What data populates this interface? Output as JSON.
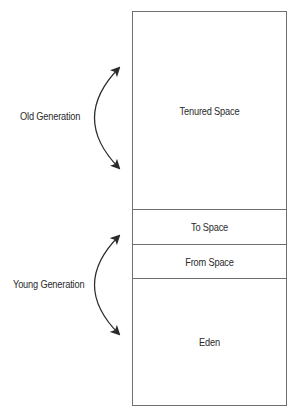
{
  "diagram": {
    "generations": [
      {
        "label": "Old Generation",
        "regions": [
          "Tenured Space"
        ]
      },
      {
        "label": "Young Generation",
        "regions": [
          "To Space",
          "From Space",
          "Eden"
        ]
      }
    ],
    "regions": {
      "tenured": "Tenured Space",
      "to_space": "To Space",
      "from_space": "From Space",
      "eden": "Eden"
    },
    "labels": {
      "old_generation": "Old Generation",
      "young_generation": "Young Generation"
    },
    "colors": {
      "border": "#6f6f6f",
      "text": "#2a2a2a",
      "arrow": "#2a2a2a",
      "background": "#ffffff"
    }
  }
}
